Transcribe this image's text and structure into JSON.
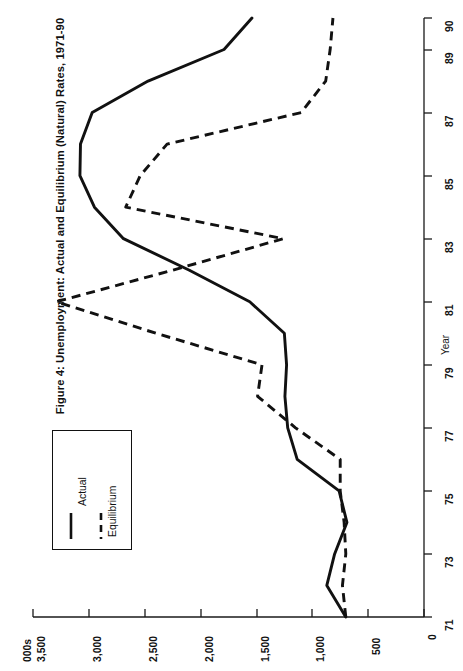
{
  "title": "Figure 4:  Unemployment: Actual and Equilibrium (Natural) Rates, 1971-90",
  "axes": {
    "value_units_label": "000s",
    "year_axis_title": "Year"
  },
  "legend": {
    "entries": [
      {
        "label": "Actual",
        "style": "solid",
        "icon": "solid-line-icon"
      },
      {
        "label": "Equilibrium",
        "style": "dashed",
        "icon": "dashed-line-icon"
      }
    ]
  },
  "chart_data": {
    "type": "line",
    "title": "Figure 4:  Unemployment: Actual and Equilibrium (Natural) Rates, 1971-90",
    "subtitle": "",
    "orientation": "rotated-90-ccw",
    "xlabel": "Year",
    "ylabel": "000s",
    "xlim": [
      1971,
      1990
    ],
    "ylim": [
      0,
      3500
    ],
    "ytick_labels": [
      "0",
      "500",
      "1,000",
      "1,500",
      "2,000",
      "2,500",
      "3,000",
      "3,500"
    ],
    "ytick_values": [
      0,
      500,
      1000,
      1500,
      2000,
      2500,
      3000,
      3500
    ],
    "xtick_labels": [
      "71",
      "73",
      "75",
      "77",
      "79",
      "81",
      "83",
      "85",
      "87",
      "89",
      "90"
    ],
    "xtick_values": [
      1971,
      1973,
      1975,
      1977,
      1979,
      1981,
      1983,
      1985,
      1987,
      1989,
      1990
    ],
    "grid": false,
    "legend_position": "lower-left",
    "x": [
      1971,
      1972,
      1973,
      1974,
      1975,
      1976,
      1977,
      1978,
      1979,
      1980,
      1981,
      1982,
      1983,
      1984,
      1985,
      1986,
      1987,
      1988,
      1989,
      1990
    ],
    "series": [
      {
        "name": "Actual",
        "style": "solid",
        "values": [
          700,
          870,
          800,
          690,
          760,
          1135,
          1220,
          1245,
          1230,
          1250,
          1560,
          2100,
          2690,
          2950,
          3080,
          3075,
          2970,
          2470,
          1790,
          1540
        ]
      },
      {
        "name": "Equilibrium",
        "style": "dashed",
        "values": [
          700,
          730,
          700,
          715,
          750,
          750,
          1150,
          1490,
          1450,
          2400,
          3290,
          2250,
          1260,
          2670,
          2540,
          2300,
          1100,
          880,
          840,
          815
        ]
      }
    ]
  }
}
